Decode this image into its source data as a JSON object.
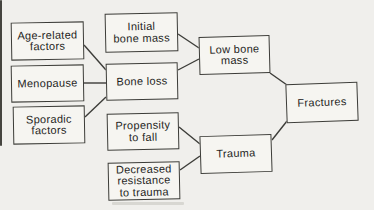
{
  "figure": {
    "type": "flow-diagram",
    "colors": {
      "background": "#f0efec",
      "node_fill": "#f6f5f1",
      "stroke": "#3c3c38",
      "text": "#1f1f1d"
    },
    "nodes": [
      {
        "id": "age-related-factors",
        "lines": [
          "Age-related",
          "factors"
        ],
        "x": 11,
        "y": 22,
        "w": 73,
        "h": 38,
        "tilt": -1
      },
      {
        "id": "initial-bone-mass",
        "lines": [
          "Initial",
          "bone mass"
        ],
        "x": 105,
        "y": 13,
        "w": 73,
        "h": 39,
        "tilt": -1.2
      },
      {
        "id": "menopause",
        "lines": [
          "Menopause"
        ],
        "x": 11,
        "y": 65,
        "w": 73,
        "h": 37,
        "tilt": -1
      },
      {
        "id": "bone-loss",
        "lines": [
          "Bone loss"
        ],
        "x": 106,
        "y": 63,
        "w": 72,
        "h": 37,
        "tilt": -1.2
      },
      {
        "id": "sporadic-factors",
        "lines": [
          "Sporadic",
          "factors"
        ],
        "x": 13,
        "y": 106,
        "w": 72,
        "h": 38,
        "tilt": -1
      },
      {
        "id": "low-bone-mass",
        "lines": [
          "Low bone",
          "mass"
        ],
        "x": 199,
        "y": 36,
        "w": 71,
        "h": 38,
        "tilt": -1.5
      },
      {
        "id": "propensity-to-fall",
        "lines": [
          "Propensity",
          "to fall"
        ],
        "x": 107,
        "y": 113,
        "w": 72,
        "h": 37,
        "tilt": -1.2
      },
      {
        "id": "decreased-resistance-to-trauma",
        "lines": [
          "Decreased",
          "resistance",
          "to trauma"
        ],
        "x": 108,
        "y": 162,
        "w": 72,
        "h": 38,
        "tilt": -1.2
      },
      {
        "id": "trauma",
        "lines": [
          "Trauma"
        ],
        "x": 200,
        "y": 135,
        "w": 72,
        "h": 38,
        "tilt": -1.8
      },
      {
        "id": "fractures",
        "lines": [
          "Fractures"
        ],
        "x": 286,
        "y": 83,
        "w": 72,
        "h": 39,
        "tilt": -2
      }
    ],
    "edges": [
      {
        "from": "age-related-factors",
        "to": "bone-loss",
        "x1": 84,
        "y1": 45,
        "x2": 106,
        "y2": 70
      },
      {
        "from": "menopause",
        "to": "bone-loss",
        "x1": 84,
        "y1": 83,
        "x2": 106,
        "y2": 83
      },
      {
        "from": "sporadic-factors",
        "to": "bone-loss",
        "x1": 85,
        "y1": 117,
        "x2": 106,
        "y2": 97
      },
      {
        "from": "initial-bone-mass",
        "to": "low-bone-mass",
        "x1": 178,
        "y1": 34,
        "x2": 199,
        "y2": 48
      },
      {
        "from": "bone-loss",
        "to": "low-bone-mass",
        "x1": 178,
        "y1": 70,
        "x2": 199,
        "y2": 59
      },
      {
        "from": "low-bone-mass",
        "to": "fractures",
        "x1": 270,
        "y1": 73,
        "x2": 287,
        "y2": 85
      },
      {
        "from": "propensity-to-fall",
        "to": "trauma",
        "x1": 179,
        "y1": 127,
        "x2": 200,
        "y2": 144
      },
      {
        "from": "decreased-resistance-to-trauma",
        "to": "trauma",
        "x1": 180,
        "y1": 170,
        "x2": 200,
        "y2": 156
      },
      {
        "from": "trauma",
        "to": "fractures",
        "x1": 272,
        "y1": 140,
        "x2": 287,
        "y2": 121
      }
    ],
    "scan_marks": [
      {
        "x": 0,
        "y": 0,
        "w": 2,
        "h": 146,
        "color": "#45443f"
      },
      {
        "x": 112,
        "y": 202,
        "w": 72,
        "h": 3,
        "color": "#d8d7d2"
      }
    ]
  }
}
